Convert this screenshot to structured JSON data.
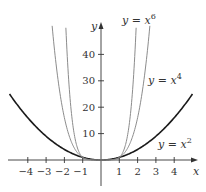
{
  "chart_data": {
    "type": "line",
    "title": "",
    "xlabel": "x",
    "ylabel": "y",
    "xlim": [
      -5,
      5
    ],
    "ylim": [
      -5,
      52
    ],
    "grid": false,
    "x_ticks": [
      -4,
      -3,
      -2,
      -1,
      1,
      2,
      3,
      4
    ],
    "y_ticks": [
      10,
      20,
      30,
      40
    ],
    "series": [
      {
        "name": "y = x^2",
        "label_base": "y = x",
        "exponent": "2",
        "power": 2,
        "color": "#1a1a1a",
        "width": 1.6,
        "x_range": [
          -5,
          5
        ],
        "label_pos": [
          158,
          148
        ]
      },
      {
        "name": "y = x^4",
        "label_base": "y = x",
        "exponent": "4",
        "power": 4,
        "color": "#8c8c8c",
        "width": 1.0,
        "x_range": [
          -2.67,
          2.67
        ],
        "label_pos": [
          148,
          84
        ]
      },
      {
        "name": "y = x^6",
        "label_base": "y = x",
        "exponent": "6",
        "power": 6,
        "color": "#8c8c8c",
        "width": 1.0,
        "x_range": [
          -1.92,
          1.92
        ],
        "label_pos": [
          122,
          24
        ]
      }
    ]
  },
  "layout": {
    "origin_px": [
      101,
      160
    ],
    "x_unit_px": 18.3,
    "y_unit_px": 2.64,
    "x_axis_px": [
      8,
      198
    ],
    "y_axis_px": [
      22,
      186
    ],
    "axis_color": "#333333"
  }
}
